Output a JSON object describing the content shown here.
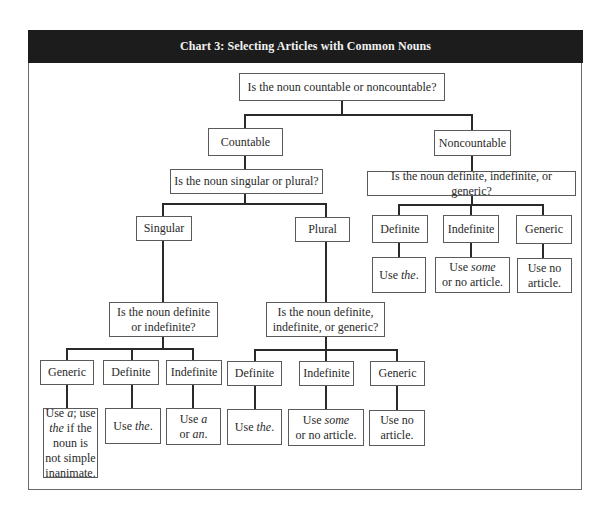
{
  "chart": {
    "title": "Chart 3: Selecting Articles with Common Nouns",
    "root": "Is the noun countable or noncountable?",
    "countable": {
      "label": "Countable",
      "question": "Is the noun singular or plural?",
      "singular": {
        "label": "Singular",
        "question_line1": "Is the noun definite",
        "question_line2": "or indefinite?",
        "options": [
          {
            "label": "Generic",
            "result": [
              "Use ",
              "a",
              "; use ",
              "the",
              " if the noun is not simple inanimate."
            ]
          },
          {
            "label": "Definite",
            "result": [
              "Use ",
              "the",
              "."
            ]
          },
          {
            "label": "Indefinite",
            "result": [
              "Use ",
              "a",
              " or ",
              "an",
              "."
            ]
          }
        ]
      },
      "plural": {
        "label": "Plural",
        "question_line1": "Is the noun definite,",
        "question_line2": "indefinite, or generic?",
        "options": [
          {
            "label": "Definite",
            "result": [
              "Use ",
              "the",
              "."
            ]
          },
          {
            "label": "Indefinite",
            "result": [
              "Use ",
              "some",
              " or no article."
            ]
          },
          {
            "label": "Generic",
            "result": [
              "Use no article."
            ]
          }
        ]
      }
    },
    "noncountable": {
      "label": "Noncountable",
      "question": "Is the noun definite, indefinite, or generic?",
      "options": [
        {
          "label": "Definite",
          "result": [
            "Use ",
            "the",
            "."
          ]
        },
        {
          "label": "Indefinite",
          "result": [
            "Use ",
            "some",
            " or no article."
          ]
        },
        {
          "label": "Generic",
          "result": [
            "Use no article."
          ]
        }
      ]
    }
  }
}
